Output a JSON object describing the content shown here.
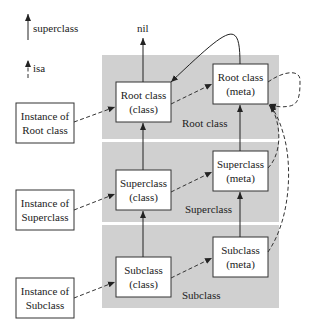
{
  "legend": {
    "superclass_label": "superclass",
    "isa_label": "isa"
  },
  "nil_label": "nil",
  "panels": [
    {
      "label": "Root class"
    },
    {
      "label": "Superclass"
    },
    {
      "label": "Subclass"
    }
  ],
  "instances": [
    {
      "line1": "Instance of",
      "line2": "Root class"
    },
    {
      "line1": "Instance of",
      "line2": "Superclass"
    },
    {
      "line1": "Instance of",
      "line2": "Subclass"
    }
  ],
  "classes": [
    {
      "line1": "Root class",
      "line2": "(class)"
    },
    {
      "line1": "Superclass",
      "line2": "(class)"
    },
    {
      "line1": "Subclass",
      "line2": "(class)"
    }
  ],
  "metas": [
    {
      "line1": "Root class",
      "line2": "(meta)"
    },
    {
      "line1": "Superclass",
      "line2": "(meta)"
    },
    {
      "line1": "Subclass",
      "line2": "(meta)"
    }
  ],
  "colors": {
    "panel": "#d0d0d0",
    "box": "#ffffff",
    "line": "#222222"
  }
}
